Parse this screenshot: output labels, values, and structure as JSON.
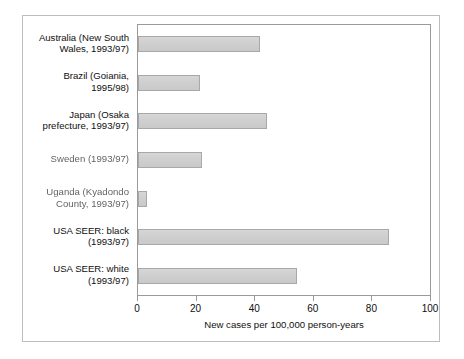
{
  "chart_data": {
    "type": "bar",
    "orientation": "horizontal",
    "title": "",
    "subtitle": "",
    "xlabel": "New cases per 100,000 person-years",
    "ylabel": "",
    "xlim": [
      0,
      100
    ],
    "xticks": [
      0,
      20,
      40,
      60,
      80,
      100
    ],
    "xtick_labels": [
      "0",
      "20",
      "40",
      "60",
      "80",
      "100"
    ],
    "grid": false,
    "legend": null,
    "legend_position": "none",
    "categories": [
      "Australia (New South Wales, 1993/97)",
      "Brazil (Goiania, 1995/98)",
      "Japan (Osaka prefecture, 1993/97)",
      "Sweden (1993/97)",
      "Uganda (Kyadondo County, 1993/97)",
      "USA SEER: black (1993/97)",
      "USA SEER: white (1993/97)"
    ],
    "values": [
      41.5,
      21.0,
      44.0,
      21.8,
      3.2,
      85.7,
      54.4
    ],
    "bar_color": "#cfcfcf",
    "bar_border_color": "#a8a8a8",
    "axis_color": "#9a9a9a",
    "frame_color": "#bdbdbd"
  },
  "labels": [
    {
      "line1": "Australia (New South",
      "line2": "Wales, 1993/97)",
      "degraded": false
    },
    {
      "line1": "Brazil (Goiania,",
      "line2": "1995/98)",
      "degraded": false
    },
    {
      "line1": "Japan (Osaka",
      "line2": "prefecture, 1993/97)",
      "degraded": false
    },
    {
      "line1": "Sweden (1993/97)",
      "line2": "",
      "degraded": true
    },
    {
      "line1": "Uganda (Kyadondo",
      "line2": "County, 1993/97)",
      "degraded": true
    },
    {
      "line1": "USA SEER: black",
      "line2": "(1993/97)",
      "degraded": false
    },
    {
      "line1": "USA SEER: white",
      "line2": "(1993/97)",
      "degraded": false
    }
  ]
}
